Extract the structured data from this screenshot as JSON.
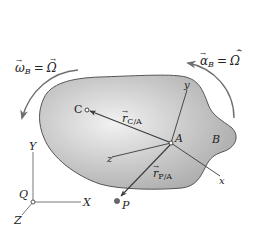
{
  "figure": {
    "type": "rigid-body-kinematics",
    "body_label": "B",
    "points": {
      "A": {
        "label": "A"
      },
      "C": {
        "label": "C"
      },
      "P": {
        "label": "P"
      },
      "Q": {
        "label": "Q"
      }
    },
    "vectors": {
      "r_CA": {
        "symbol": "r",
        "subscript": "C/A"
      },
      "r_PA": {
        "symbol": "r",
        "subscript": "P/A"
      }
    },
    "moving_frame_axes": {
      "x": "x",
      "y": "y",
      "z": "z"
    },
    "fixed_frame_axes": {
      "X": "X",
      "Y": "Y",
      "Z": "Z"
    },
    "angular_velocity": {
      "lhs_symbol": "ω",
      "lhs_subscript": "B",
      "equals": "=",
      "rhs_symbol": "Ω"
    },
    "angular_acceleration": {
      "lhs_symbol": "α",
      "lhs_subscript": "B",
      "equals": "=",
      "rhs_symbol": "Ω"
    }
  },
  "colors": {
    "body_fill_light": "#e6e6e6",
    "body_fill_dark": "#b4b4b4",
    "body_outline": "#555555",
    "line": "#3a3a3a",
    "arrow_gray": "#777777",
    "text": "#222222"
  }
}
